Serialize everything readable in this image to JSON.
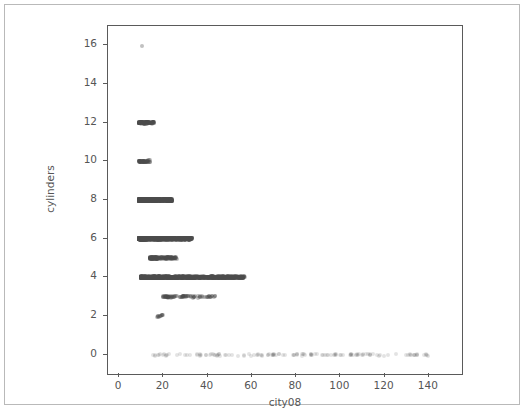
{
  "figure": {
    "background_color": "#ffffff",
    "frame_color": "#b9b9b9",
    "axis_color": "#5a5a5a",
    "text_color": "#555555",
    "marker_color": "#4d4d4d"
  },
  "chart_data": {
    "type": "scatter",
    "title": "",
    "xlabel": "city08",
    "ylabel": "cylinders",
    "xlim": [
      -5,
      155
    ],
    "ylim": [
      -1,
      17
    ],
    "xticks": [
      0,
      20,
      40,
      60,
      80,
      100,
      120,
      140
    ],
    "yticks": [
      0,
      2,
      4,
      6,
      8,
      10,
      12,
      14,
      16
    ],
    "xtick_labels": [
      "0",
      "20",
      "40",
      "60",
      "80",
      "100",
      "120",
      "140"
    ],
    "ytick_labels": [
      "0",
      "2",
      "4",
      "6",
      "8",
      "10",
      "12",
      "14",
      "16"
    ],
    "grid": false,
    "legend": null,
    "marker": {
      "shape": "circle",
      "color": "#4d4d4d",
      "alpha": 0.35,
      "size": 4
    },
    "series": [
      {
        "name": "vehicles",
        "bands": [
          {
            "cylinders": 16,
            "x_min": 10,
            "x_max": 10,
            "density": "single",
            "count": 1
          },
          {
            "cylinders": 12,
            "x_min": 9,
            "x_max": 16,
            "density": "high",
            "count": 120
          },
          {
            "cylinders": 10,
            "x_min": 9,
            "x_max": 14,
            "density": "high",
            "count": 60
          },
          {
            "cylinders": 8,
            "x_min": 9,
            "x_max": 24,
            "density": "very-high",
            "count": 900
          },
          {
            "cylinders": 6,
            "x_min": 9,
            "x_max": 33,
            "density": "very-high",
            "count": 1100
          },
          {
            "cylinders": 5,
            "x_min": 14,
            "x_max": 26,
            "density": "medium",
            "count": 180
          },
          {
            "cylinders": 4,
            "x_min": 10,
            "x_max": 57,
            "density": "very-high",
            "count": 1300
          },
          {
            "cylinders": 3,
            "x_min": 20,
            "x_max": 44,
            "density": "medium",
            "count": 90
          },
          {
            "cylinders": 2,
            "x_min": 17,
            "x_max": 20,
            "density": "low",
            "count": 12
          },
          {
            "cylinders": 0,
            "x_min": 15,
            "x_max": 140,
            "density": "sparse",
            "count": 140
          }
        ]
      }
    ]
  }
}
